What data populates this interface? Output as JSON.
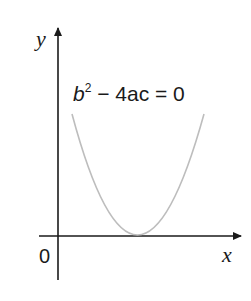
{
  "diagram": {
    "type": "parabola-graph",
    "axes": {
      "x_label": "x",
      "y_label": "y",
      "origin_label": "0"
    },
    "curve": {
      "equation_label_b": "b",
      "equation_label_exp": "2",
      "equation_label_rest": " − 4ac = 0",
      "description": "Upward parabola touching the x-axis at exactly one point (discriminant zero)",
      "color": "#bdbdbd"
    },
    "colors": {
      "axis": "#1a1a1a",
      "background": "#ffffff"
    }
  }
}
